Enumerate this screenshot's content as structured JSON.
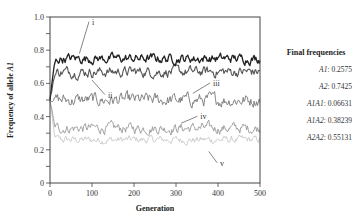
{
  "chart_data": {
    "type": "line",
    "title": "",
    "xlabel": "Generation",
    "ylabel": "Frequency of allele A1",
    "xlim": [
      0,
      500
    ],
    "ylim": [
      0,
      1.0
    ],
    "x_ticks": [
      0,
      100,
      200,
      300,
      400,
      500
    ],
    "y_ticks": [
      0,
      0.2,
      0.4,
      0.6,
      0.8,
      1.0
    ],
    "y_tick_labels": [
      "0",
      "0.2",
      "0.4",
      "0.6",
      "0.8",
      "1.0"
    ],
    "grid": false,
    "series": [
      {
        "name": "i",
        "start": 0.5,
        "mean": 0.75,
        "noise": 0.018,
        "color": "#222222",
        "width": 1.3,
        "label_x": 100,
        "label_y": 0.96,
        "pointer_to": [
          70,
          0.78
        ]
      },
      {
        "name": "ii",
        "start": 0.5,
        "mean": 0.67,
        "noise": 0.02,
        "color": "#555555",
        "width": 1.1,
        "label_x": 138,
        "label_y": 0.52,
        "pointer_to": [
          100,
          0.62
        ]
      },
      {
        "name": "iii",
        "start": 0.5,
        "mean": 0.5,
        "noise": 0.025,
        "color": "#777777",
        "width": 0.9,
        "label_x": 388,
        "label_y": 0.59,
        "pointer_to": [
          340,
          0.54
        ]
      },
      {
        "name": "iv",
        "start": 0.5,
        "mean": 0.33,
        "noise": 0.02,
        "color": "#999999",
        "width": 0.9,
        "label_x": 358,
        "label_y": 0.39,
        "pointer_to": [
          312,
          0.36
        ]
      },
      {
        "name": "v",
        "start": 0.5,
        "mean": 0.26,
        "noise": 0.015,
        "color": "#c8c8c8",
        "width": 0.9,
        "label_x": 405,
        "label_y": 0.11,
        "pointer_to": [
          378,
          0.19
        ]
      }
    ]
  },
  "panel": {
    "title": "Final frequencies",
    "rows": [
      {
        "key": "A1",
        "value": "0.2575"
      },
      {
        "key": "A2",
        "value": "0.7425"
      },
      {
        "key": "A1A1",
        "value": "0.06631"
      },
      {
        "key": "A1A2",
        "value": "0.38239"
      },
      {
        "key": "A2A2",
        "value": "0.55131"
      }
    ]
  }
}
